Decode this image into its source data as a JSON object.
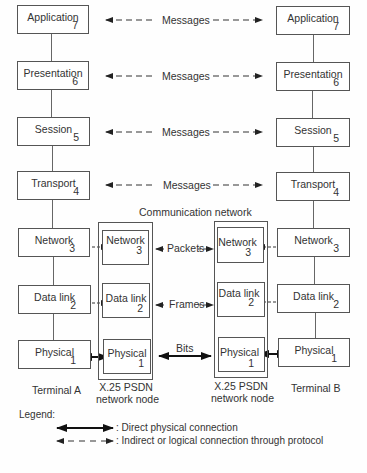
{
  "terminal_a": {
    "label": "Terminal A",
    "layers": [
      {
        "name": "Application",
        "num": "7"
      },
      {
        "name": "Presentation",
        "num": "6"
      },
      {
        "name": "Session",
        "num": "5"
      },
      {
        "name": "Transport",
        "num": "4"
      },
      {
        "name": "Network",
        "num": "3"
      },
      {
        "name": "Data link",
        "num": "2"
      },
      {
        "name": "Physical",
        "num": "1"
      }
    ]
  },
  "terminal_b": {
    "label": "Terminal B",
    "layers": [
      {
        "name": "Application",
        "num": "7"
      },
      {
        "name": "Presentation",
        "num": "6"
      },
      {
        "name": "Session",
        "num": "5"
      },
      {
        "name": "Transport",
        "num": "4"
      },
      {
        "name": "Network",
        "num": "3"
      },
      {
        "name": "Data link",
        "num": "2"
      },
      {
        "name": "Physical",
        "num": "1"
      }
    ]
  },
  "node_left": {
    "label_line1": "X.25 PSDN",
    "label_line2": "network node",
    "layers": [
      {
        "name": "Network",
        "num": "3"
      },
      {
        "name": "Data link",
        "num": "2"
      },
      {
        "name": "Physical",
        "num": "1"
      }
    ]
  },
  "node_right": {
    "label_line1": "X.25 PSDN",
    "label_line2": "network node",
    "layers": [
      {
        "name": "Network",
        "num": "3"
      },
      {
        "name": "Data link",
        "num": "2"
      },
      {
        "name": "Physical",
        "num": "1"
      }
    ]
  },
  "communication_network_label": "Communication network",
  "connections": {
    "application": "Messages",
    "presentation": "Messages",
    "session": "Messages",
    "transport": "Messages",
    "network": "Packets",
    "data_link": "Frames",
    "physical": "Bits"
  },
  "legend": {
    "title": "Legend:",
    "solid": ": Direct physical connection",
    "dashed": ": Indirect or logical connection through protocol"
  }
}
